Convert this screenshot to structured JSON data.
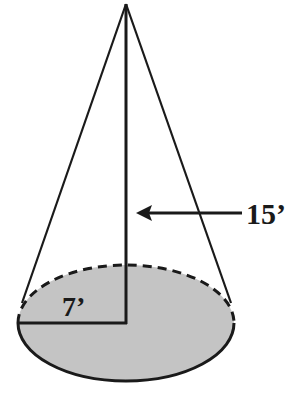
{
  "figure": {
    "type": "right circular cone",
    "labels": {
      "radius": "7’",
      "height": "15’"
    },
    "colors": {
      "base_fill": "#c4c4c4",
      "stroke": "#1a1a1a",
      "background": "#ffffff"
    }
  }
}
